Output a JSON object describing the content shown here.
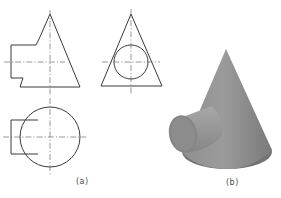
{
  "figure": {
    "panel_a": {
      "label": "(a)",
      "description": "Orthographic projection: front, side and top views of a cone with a horizontal cylinder intersecting it"
    },
    "panel_b": {
      "label": "(b)",
      "description": "Shaded 3D view of cone intersected by cylinder"
    }
  },
  "colors": {
    "line": "#3a3a3a",
    "centerline": "#6a6a6a",
    "cone_light": "#9a9a9a",
    "cone_dark": "#6e6e6e",
    "cylinder_face": "#8a8a8a",
    "cylinder_body": "#a0a0a0",
    "background": "#ffffff"
  }
}
